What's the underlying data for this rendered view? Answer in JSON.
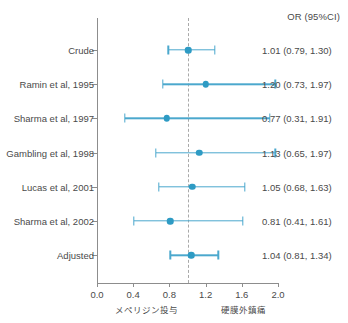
{
  "header": {
    "or_column_label": "OR (95%CI)"
  },
  "axis": {
    "x_ticks": [
      "0.0",
      "0.4",
      "0.8",
      "1.2",
      "1.6",
      "2.0"
    ],
    "x_min": 0.0,
    "x_max": 2.0,
    "reference_value": 1.0,
    "left_annotation": "メペリジン投与",
    "right_annotation": "硬膜外鎮痛"
  },
  "colors": {
    "marker": "#2e9bc4",
    "whisker": "#4ba8cd",
    "axis": "#8d8d8d",
    "reference": "#a9a9a9",
    "text": "#4a4a4a"
  },
  "rows": [
    {
      "label": "Crude",
      "value_text": "1.01 (0.79, 1.30)",
      "or": 1.01,
      "lo": 0.79,
      "hi": 1.3
    },
    {
      "label": "Ramin et al, 1995",
      "value_text": "1.20 (0.73, 1.97)",
      "or": 1.2,
      "lo": 0.73,
      "hi": 1.97
    },
    {
      "label": "Sharma et al, 1997",
      "value_text": "0.77 (0.31, 1.91)",
      "or": 0.77,
      "lo": 0.31,
      "hi": 1.91
    },
    {
      "label": "Gambling et al, 1998",
      "value_text": "1.13 (0.65, 1.97)",
      "or": 1.13,
      "lo": 0.65,
      "hi": 1.97
    },
    {
      "label": "Lucas et al, 2001",
      "value_text": "1.05 (0.68, 1.63)",
      "or": 1.05,
      "lo": 0.68,
      "hi": 1.63
    },
    {
      "label": "Sharma et al, 2002",
      "value_text": "0.81 (0.41, 1.61)",
      "or": 0.81,
      "lo": 0.41,
      "hi": 1.61
    },
    {
      "label": "Adjusted",
      "value_text": "1.04 (0.81, 1.34)",
      "or": 1.04,
      "lo": 0.81,
      "hi": 1.34
    }
  ],
  "chart_data": {
    "type": "scatter",
    "title": "",
    "xlabel": "",
    "ylabel": "",
    "xlim": [
      0.0,
      2.0
    ],
    "grid": false,
    "legend": "none",
    "reference_line": 1.0,
    "xtick_labels": [
      "0.0",
      "0.4",
      "0.8",
      "1.2",
      "1.6",
      "2.0"
    ],
    "categories": [
      "Crude",
      "Ramin et al, 1995",
      "Sharma et al, 1997",
      "Gambling et al, 1998",
      "Lucas et al, 2001",
      "Sharma et al, 2002",
      "Adjusted"
    ],
    "values": [
      1.01,
      1.2,
      0.77,
      1.13,
      1.05,
      0.81,
      1.04
    ],
    "ci_lower": [
      0.79,
      0.73,
      0.31,
      0.65,
      0.68,
      0.41,
      0.81
    ],
    "ci_upper": [
      1.3,
      1.97,
      1.91,
      1.97,
      1.63,
      1.61,
      1.34
    ],
    "value_labels": [
      "1.01 (0.79, 1.30)",
      "1.20 (0.73, 1.97)",
      "0.77 (0.31, 1.91)",
      "1.13 (0.65, 1.97)",
      "1.05 (0.68, 1.63)",
      "0.81 (0.41, 1.61)",
      "1.04 (0.81, 1.34)"
    ],
    "annotations": [
      "メペリジン投与",
      "硬膜外鎮痛",
      "OR (95%CI)"
    ]
  }
}
